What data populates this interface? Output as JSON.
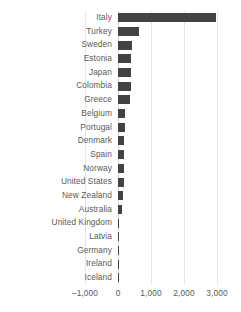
{
  "chart_data": {
    "type": "bar",
    "orientation": "horizontal",
    "title": "",
    "subtitle": "",
    "xlabel": "",
    "ylabel": "",
    "xlim": [
      -1000,
      3000
    ],
    "ylim": null,
    "grid": true,
    "grid_axis": "x",
    "legend": false,
    "legend_position": "none",
    "bar_color": "#434345",
    "grid_color": "#e6e6e6",
    "text_color": "#59595b",
    "background_color": "#ffffff",
    "xticks": [
      -1000,
      0,
      1000,
      2000,
      3000
    ],
    "xtick_labels": [
      "–1,000",
      "0",
      "1,000",
      "2,000",
      "3,000"
    ],
    "categories": [
      "Italy",
      "Turkey",
      "Sweden",
      "Estonia",
      "Japan",
      "Colombia",
      "Greece",
      "Belgium",
      "Portugal",
      "Denmark",
      "Spain",
      "Norway",
      "United States",
      "New Zealand",
      "Australia",
      "United Kingdom",
      "Latvia",
      "Germany",
      "Ireland",
      "Iceland"
    ],
    "values": [
      2970,
      640,
      430,
      390,
      390,
      390,
      350,
      210,
      200,
      180,
      170,
      170,
      170,
      140,
      120,
      20,
      15,
      15,
      10,
      10
    ],
    "series": [
      {
        "name": "value",
        "values": [
          2970,
          640,
          430,
          390,
          390,
          390,
          350,
          210,
          200,
          180,
          170,
          170,
          170,
          140,
          120,
          20,
          15,
          15,
          10,
          10
        ]
      }
    ]
  }
}
